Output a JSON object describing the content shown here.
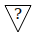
{
  "icon": {
    "semantic": "unknown-warning-triangle-icon",
    "glyph": "?",
    "stroke_color": "#000000",
    "background_color": "#ffffff"
  }
}
